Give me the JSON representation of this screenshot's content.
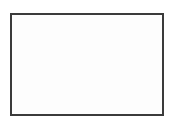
{
  "figure": {
    "background_color": "#ffffff",
    "canvas_color": "#fefefe"
  },
  "chart_data": {
    "type": "diagram-grid",
    "title": "",
    "subtitle": "",
    "xlabel": "",
    "ylabel": "",
    "grid": true,
    "legend": null,
    "columns": 7,
    "rows": 1,
    "interior_dividers": 6,
    "vertical_line_positions": [
      11,
      32.3,
      53.7,
      75,
      96.3,
      117.7,
      139,
      163
    ],
    "categories": [
      "1",
      "2",
      "3",
      "4",
      "5",
      "6",
      "7"
    ],
    "values": [
      1,
      1,
      1,
      1,
      1,
      1,
      1
    ],
    "annotations": []
  },
  "frame": {
    "x": 11,
    "y": 14,
    "width": 152,
    "height": 101,
    "stroke_color": "#3b3b3b",
    "stroke_width": 2,
    "fill_color": "#fdfdfd"
  },
  "dividers": {
    "stroke_color": "#3f3f3f",
    "stroke_width": 2,
    "count": 6,
    "x_positions": [
      32.3,
      53.7,
      75,
      96.3,
      117.7,
      139
    ],
    "y_top": 14,
    "y_bottom": 115
  },
  "cells": [
    {
      "index": 1,
      "label": "",
      "x": 11,
      "width": 21.3
    },
    {
      "index": 2,
      "label": "",
      "x": 32.3,
      "width": 21.4
    },
    {
      "index": 3,
      "label": "",
      "x": 53.7,
      "width": 21.3
    },
    {
      "index": 4,
      "label": "",
      "x": 75,
      "width": 21.3
    },
    {
      "index": 5,
      "label": "",
      "x": 96.3,
      "width": 21.4
    },
    {
      "index": 6,
      "label": "",
      "x": 117.7,
      "width": 21.3
    },
    {
      "index": 7,
      "label": "",
      "x": 139,
      "width": 24
    }
  ]
}
